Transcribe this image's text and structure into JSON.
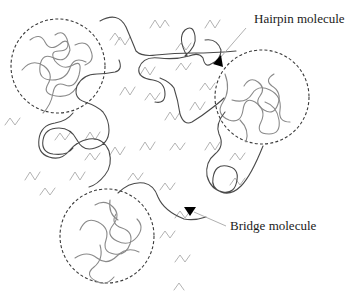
{
  "diagram": {
    "title": "",
    "annotations": [
      {
        "id": "hairpin",
        "label": "Hairpin molecule",
        "x": 254,
        "y": 11
      },
      {
        "id": "bridge",
        "label": "Bridge molecule",
        "x": 230,
        "y": 218
      }
    ],
    "regions": [
      {
        "id": "coil-region-top-left",
        "shape": "dashed-circle",
        "cx": 58,
        "cy": 66,
        "r": 47
      },
      {
        "id": "coil-region-right",
        "shape": "dashed-circle",
        "cx": 262,
        "cy": 97,
        "r": 47
      },
      {
        "id": "coil-region-bottom-left",
        "shape": "dashed-circle",
        "cx": 107,
        "cy": 236,
        "r": 47
      }
    ],
    "elements": {
      "main_chain": "long polymer chain linking the coil regions",
      "short_chains": "zig-zag short segments scattered in amorphous matrix"
    },
    "colors": {
      "main_chain": "#4a4a4a",
      "coil": "#8a8a8a",
      "zigzag": "#b3b3b3",
      "region_border": "#3a3a3a",
      "arrowhead": "#000000",
      "text": "#1a1a1a"
    }
  }
}
